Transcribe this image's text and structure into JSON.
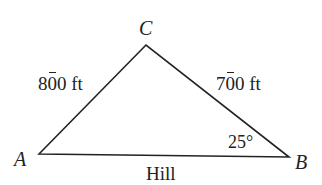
{
  "diagram": {
    "type": "triangle",
    "vertices": [
      {
        "id": "A",
        "label": "A",
        "x": 39,
        "y": 154
      },
      {
        "id": "B",
        "label": "B",
        "x": 289,
        "y": 157
      },
      {
        "id": "C",
        "label": "C",
        "x": 146,
        "y": 45
      }
    ],
    "sides": {
      "AC": {
        "label_digit_overlined": "8",
        "label_digit_mark": "0",
        "label_rest": "0 ft",
        "full_label": "8̄00 ft"
      },
      "BC": {
        "label_digit_overlined": "7",
        "label_digit_mark": "0",
        "label_rest": "0 ft",
        "full_label": "7̄00 ft"
      },
      "AB": {
        "label": "Hill"
      }
    },
    "angle_B": {
      "label": "25°"
    },
    "line_color": "#222222"
  }
}
